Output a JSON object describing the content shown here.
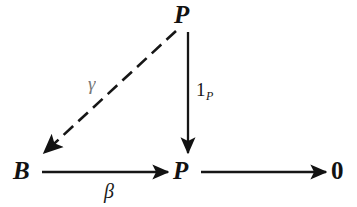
{
  "diagram": {
    "type": "commutative-diagram",
    "title": "",
    "background_color": "#ffffff",
    "ink_color": "#121212",
    "width": 357,
    "height": 207,
    "nodes": [
      {
        "id": "p-top",
        "label": "P",
        "style": "italic-serif-bold",
        "x": 185,
        "y": 15
      },
      {
        "id": "b",
        "label": "B",
        "style": "italic-serif-bold",
        "x": 24,
        "y": 171
      },
      {
        "id": "p-bottom",
        "label": "P",
        "style": "italic-serif-bold",
        "x": 183,
        "y": 171
      },
      {
        "id": "zero",
        "label": "0",
        "style": "upright-serif",
        "x": 340,
        "y": 171
      }
    ],
    "edges": [
      {
        "id": "gamma-edge",
        "from": "p-top",
        "to": "b",
        "label": "γ",
        "label_name": "gamma",
        "stroke": "dashed",
        "arrowhead": "to"
      },
      {
        "id": "identity-edge",
        "from": "p-top",
        "to": "p-bottom",
        "label": "1",
        "label_subscript": "P",
        "label_name": "identity-on-p",
        "stroke": "solid",
        "arrowhead": "to"
      },
      {
        "id": "beta-edge",
        "from": "b",
        "to": "p-bottom",
        "label": "β",
        "label_name": "beta",
        "stroke": "solid",
        "arrowhead": "to"
      },
      {
        "id": "zero-edge",
        "from": "p-bottom",
        "to": "zero",
        "label": "",
        "label_name": "unlabeled",
        "stroke": "solid",
        "arrowhead": "to"
      }
    ]
  }
}
